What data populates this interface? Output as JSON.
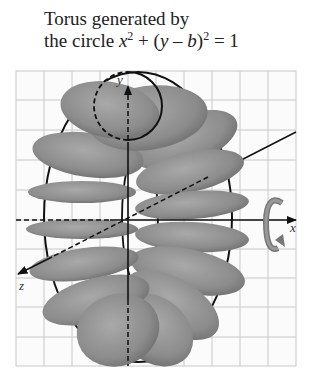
{
  "title": {
    "line1": "Torus generated by",
    "line2_prefix": "the circle ",
    "eq_x": "x",
    "eq_exp1": "2",
    "eq_mid": " + (",
    "eq_y": "y",
    "eq_minus": " – ",
    "eq_b": "b",
    "eq_close": ")",
    "eq_exp2": "2",
    "eq_rhs": " = 1"
  },
  "axes": {
    "x_label": "x",
    "y_label": "y",
    "z_label": "z"
  },
  "icons": {
    "rotation": "rotation-about-x-axis-icon"
  },
  "colors": {
    "grid": "#c8c8c8",
    "outline": "#111111",
    "tube_fill": "#8a8a8a",
    "background": "#ffffff"
  },
  "grid": {
    "columns": 10,
    "rows": 10
  }
}
